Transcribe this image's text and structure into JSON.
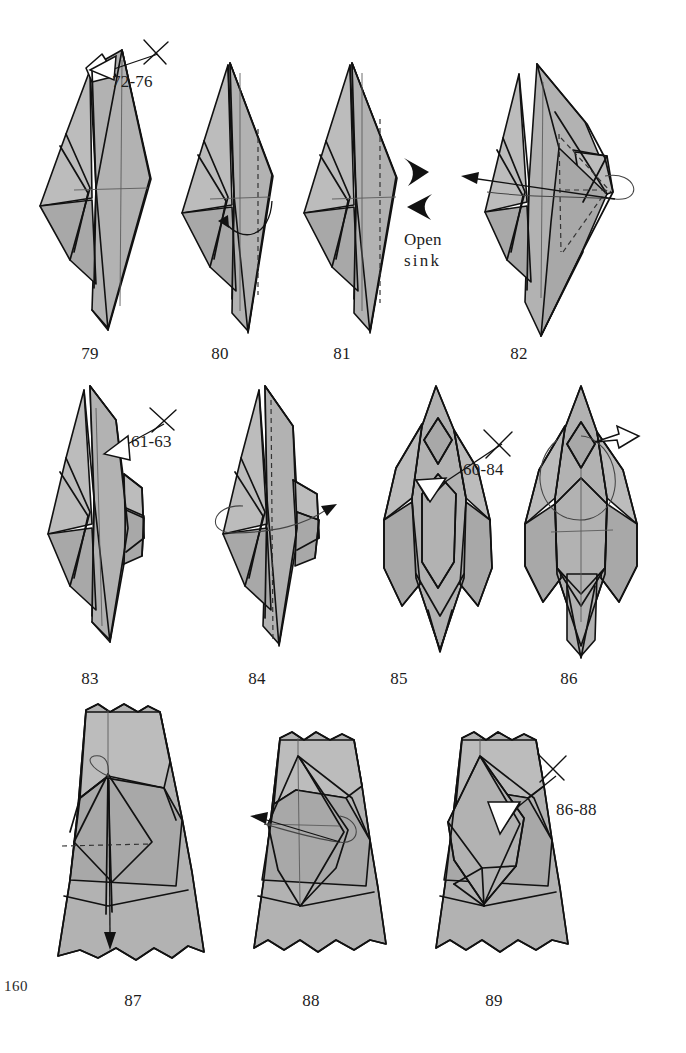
{
  "page": {
    "number": "160",
    "type": "origami-instruction-diagram-page",
    "background_color": "#ffffff",
    "paper_fill_color": "#b2b2b2",
    "ink_color": "#111111",
    "rows": 3,
    "figure_count": 11
  },
  "figures": [
    {
      "id": "fig-79",
      "caption": "79",
      "row": 1,
      "col": 1,
      "annotations": [
        "repeat-72-76"
      ],
      "symbols": [
        "hollow-repeat-arrow",
        "x-repeat-mark",
        "center-crease-line"
      ]
    },
    {
      "id": "fig-80",
      "caption": "80",
      "row": 1,
      "col": 2,
      "annotations": [],
      "symbols": [
        "valley-fold-dashed-line",
        "curved-fold-arrow",
        "center-crease-line"
      ]
    },
    {
      "id": "fig-81",
      "caption": "81",
      "row": 1,
      "col": 3,
      "annotations": [
        "open-sink"
      ],
      "symbols": [
        "valley-fold-dashed-line",
        "push-arrow-right",
        "push-arrow-left",
        "center-crease-line"
      ]
    },
    {
      "id": "fig-82",
      "caption": "82",
      "row": 1,
      "col": 4,
      "annotations": [],
      "symbols": [
        "rotate-loop-arrow",
        "hidden-edge-dashed-lines",
        "straight-arrow-left"
      ]
    },
    {
      "id": "fig-83",
      "caption": "83",
      "row": 2,
      "col": 1,
      "annotations": [
        "repeat-61-63"
      ],
      "symbols": [
        "hollow-repeat-arrow",
        "x-repeat-mark"
      ]
    },
    {
      "id": "fig-84",
      "caption": "84",
      "row": 2,
      "col": 2,
      "annotations": [],
      "symbols": [
        "rotate-loop-arrow",
        "center-dashed-axis"
      ]
    },
    {
      "id": "fig-85",
      "caption": "85",
      "row": 2,
      "col": 3,
      "annotations": [
        "repeat-60-84"
      ],
      "symbols": [
        "hollow-repeat-arrow",
        "x-repeat-mark",
        "white-triangle-flap"
      ]
    },
    {
      "id": "fig-86",
      "caption": "86",
      "row": 2,
      "col": 4,
      "annotations": [],
      "symbols": [
        "hollow-repeat-arrow",
        "rotate-circle-arrow",
        "center-crease-cross"
      ]
    },
    {
      "id": "fig-87",
      "caption": "87",
      "row": 3,
      "col": 1,
      "annotations": [],
      "symbols": [
        "valley-fold-dashed-line",
        "loop-fold-arrow",
        "down-arrow"
      ]
    },
    {
      "id": "fig-88",
      "caption": "88",
      "row": 3,
      "col": 2,
      "annotations": [],
      "symbols": [
        "rotate-loop-arrow",
        "straight-arrow-left"
      ]
    },
    {
      "id": "fig-89",
      "caption": "89",
      "row": 3,
      "col": 3,
      "annotations": [
        "repeat-86-88"
      ],
      "symbols": [
        "hollow-repeat-arrow",
        "x-repeat-mark"
      ]
    }
  ],
  "annotations": {
    "repeat_72_76": {
      "text": "72-76",
      "x": 112,
      "y": 72
    },
    "open_sink": {
      "line1": "Open",
      "line2": "sink",
      "x": 404,
      "y": 230
    },
    "repeat_61_63": {
      "text": "61-63",
      "x": 131,
      "y": 432
    },
    "repeat_60_84": {
      "text": "60-84",
      "x": 463,
      "y": 460
    },
    "repeat_86_88": {
      "text": "86-88",
      "x": 556,
      "y": 800
    }
  },
  "captions": [
    {
      "text": "79",
      "x": 90,
      "y": 348
    },
    {
      "text": "80",
      "x": 220,
      "y": 348
    },
    {
      "text": "81",
      "x": 342,
      "y": 348
    },
    {
      "text": "82",
      "x": 519,
      "y": 348
    },
    {
      "text": "83",
      "x": 90,
      "y": 673
    },
    {
      "text": "84",
      "x": 257,
      "y": 673
    },
    {
      "text": "85",
      "x": 399,
      "y": 673
    },
    {
      "text": "86",
      "x": 569,
      "y": 673
    },
    {
      "text": "87",
      "x": 133,
      "y": 995
    },
    {
      "text": "88",
      "x": 311,
      "y": 995
    },
    {
      "text": "89",
      "x": 494,
      "y": 995
    }
  ]
}
